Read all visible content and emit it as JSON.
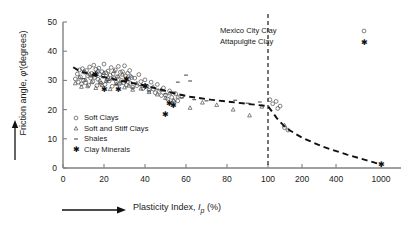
{
  "chart_data": {
    "type": "scatter",
    "title": "",
    "xlabel": "Plasticity Index, Ip (%)",
    "ylabel": "Friction angle, φ'(degrees)",
    "xlabel_parts": {
      "pre": "Plasticity Index, ",
      "sym": "I",
      "sub": "p",
      "post": " (%)"
    },
    "ylabel_parts": {
      "pre": "Friction angle, ",
      "sym": "φ′",
      "post": "(degrees)"
    },
    "x_axis": {
      "type": "linear-then-log",
      "ticks": [
        0,
        20,
        40,
        60,
        80,
        100,
        200,
        400,
        1000
      ],
      "tick_labels": [
        "0",
        "20",
        "40",
        "60",
        "80",
        "100",
        "200",
        "400",
        "1000"
      ],
      "linear_max": 100,
      "log_max": 1000
    },
    "y_axis": {
      "type": "linear",
      "ticks": [
        0,
        10,
        20,
        30,
        40,
        50
      ],
      "tick_labels": [
        "0",
        "10",
        "20",
        "30",
        "40",
        "50"
      ],
      "ylim": [
        0,
        50
      ]
    },
    "grid": false,
    "annotations": [
      {
        "name": "divider",
        "type": "vertical-dashed-line",
        "x": 100
      }
    ],
    "trend_line": {
      "style": "dashed",
      "points": [
        [
          5,
          34.5
        ],
        [
          8,
          33.2
        ],
        [
          12,
          32.4
        ],
        [
          18,
          31.4
        ],
        [
          24,
          30.6
        ],
        [
          30,
          29.6
        ],
        [
          38,
          28.6
        ],
        [
          46,
          27.2
        ],
        [
          54,
          25.6
        ],
        [
          62,
          24.4
        ],
        [
          72,
          23.4
        ],
        [
          82,
          22.6
        ],
        [
          92,
          21.8
        ],
        [
          100,
          21.2
        ],
        [
          120,
          17.0
        ],
        [
          145,
          13.6
        ],
        [
          200,
          10.4
        ],
        [
          300,
          7.4
        ],
        [
          500,
          4.6
        ],
        [
          750,
          2.6
        ],
        [
          1000,
          1.2
        ]
      ]
    },
    "legend_main": {
      "position": "inside-lower-left",
      "entries": [
        {
          "label": "Soft Clays",
          "marker": "open-circle"
        },
        {
          "label": "Soft and Stiff Clays",
          "marker": "triangle"
        },
        {
          "label": "Shales",
          "marker": "dash"
        },
        {
          "label": "Clay Minerals",
          "marker": "asterisk"
        }
      ]
    },
    "legend_right": {
      "position": "top-right",
      "entries": [
        {
          "label": "Mexico City Clay",
          "marker": "open-circle"
        },
        {
          "label": "Attapulgite Clay",
          "marker": "asterisk"
        }
      ]
    },
    "series": [
      {
        "name": "Soft Clays",
        "marker": "open-circle",
        "points": [
          [
            6,
            30.5
          ],
          [
            7,
            32.2
          ],
          [
            7.5,
            29.4
          ],
          [
            8,
            33.6
          ],
          [
            8.5,
            31.2
          ],
          [
            9,
            28.8
          ],
          [
            9.5,
            34.0
          ],
          [
            10,
            30.0
          ],
          [
            10.5,
            32.8
          ],
          [
            11,
            29.2
          ],
          [
            11.5,
            33.4
          ],
          [
            12,
            31.6
          ],
          [
            12.5,
            28.4
          ],
          [
            13,
            34.6
          ],
          [
            13.5,
            30.8
          ],
          [
            14,
            32.4
          ],
          [
            14.5,
            29.6
          ],
          [
            15,
            35.2
          ],
          [
            15.5,
            31.0
          ],
          [
            16,
            33.8
          ],
          [
            16.5,
            28.2
          ],
          [
            17,
            30.4
          ],
          [
            17.5,
            34.2
          ],
          [
            18,
            32.0
          ],
          [
            18.5,
            29.0
          ],
          [
            19,
            33.0
          ],
          [
            19.5,
            31.4
          ],
          [
            20,
            35.6
          ],
          [
            20.5,
            28.6
          ],
          [
            21,
            32.6
          ],
          [
            21.5,
            30.2
          ],
          [
            22,
            33.2
          ],
          [
            22.5,
            29.8
          ],
          [
            23,
            31.8
          ],
          [
            23.5,
            34.4
          ],
          [
            24,
            28.0
          ],
          [
            24.5,
            32.2
          ],
          [
            25,
            30.6
          ],
          [
            25.5,
            33.6
          ],
          [
            26,
            29.4
          ],
          [
            26.5,
            31.2
          ],
          [
            27,
            34.8
          ],
          [
            27.5,
            28.8
          ],
          [
            28,
            32.8
          ],
          [
            28.5,
            30.0
          ],
          [
            29,
            33.0
          ],
          [
            29.5,
            29.2
          ],
          [
            30,
            35.0
          ],
          [
            30.5,
            31.6
          ],
          [
            31,
            28.4
          ],
          [
            31.5,
            32.4
          ],
          [
            32,
            30.4
          ],
          [
            32.5,
            33.4
          ],
          [
            33,
            29.0
          ],
          [
            33.5,
            31.0
          ],
          [
            34,
            27.6
          ],
          [
            35,
            30.8
          ],
          [
            36,
            28.2
          ],
          [
            37,
            32.0
          ],
          [
            38,
            29.6
          ],
          [
            39,
            27.2
          ],
          [
            40,
            30.2
          ],
          [
            41,
            28.0
          ],
          [
            42,
            26.6
          ],
          [
            43,
            29.4
          ],
          [
            44,
            27.0
          ],
          [
            45,
            25.8
          ],
          [
            46,
            28.6
          ],
          [
            47,
            26.2
          ],
          [
            48,
            24.8
          ],
          [
            49,
            27.4
          ],
          [
            50,
            25.0
          ],
          [
            51,
            23.6
          ],
          [
            52,
            26.4
          ],
          [
            53,
            24.2
          ],
          [
            54,
            22.8
          ],
          [
            55,
            25.4
          ],
          [
            56,
            23.0
          ],
          [
            58,
            24.6
          ]
        ]
      },
      {
        "name": "Soft and Stiff Clays",
        "marker": "triangle",
        "points": [
          [
            6,
            29.0
          ],
          [
            8,
            31.0
          ],
          [
            9,
            27.8
          ],
          [
            10,
            33.0
          ],
          [
            11,
            30.2
          ],
          [
            12,
            28.0
          ],
          [
            13,
            32.2
          ],
          [
            14,
            29.4
          ],
          [
            15,
            31.8
          ],
          [
            16,
            27.4
          ],
          [
            17,
            33.4
          ],
          [
            18,
            30.0
          ],
          [
            19,
            28.4
          ],
          [
            20,
            32.6
          ],
          [
            21,
            29.8
          ],
          [
            22,
            31.2
          ],
          [
            23,
            27.0
          ],
          [
            24,
            30.6
          ],
          [
            25,
            33.2
          ],
          [
            26,
            28.8
          ],
          [
            27,
            31.4
          ],
          [
            28,
            29.2
          ],
          [
            29,
            32.0
          ],
          [
            30,
            27.6
          ],
          [
            31,
            30.4
          ],
          [
            32,
            28.2
          ],
          [
            33,
            31.6
          ],
          [
            34,
            26.8
          ],
          [
            36,
            29.0
          ],
          [
            38,
            27.2
          ],
          [
            40,
            28.4
          ],
          [
            42,
            26.0
          ],
          [
            44,
            27.8
          ],
          [
            46,
            25.2
          ],
          [
            48,
            26.8
          ],
          [
            50,
            24.0
          ],
          [
            52,
            25.6
          ],
          [
            54,
            23.2
          ],
          [
            56,
            24.4
          ],
          [
            62,
            20.6
          ],
          [
            68,
            22.4
          ],
          [
            75,
            21.6
          ],
          [
            83,
            20.0
          ],
          [
            91,
            18.0
          ],
          [
            97,
            21.0
          ],
          [
            140,
            14.6
          ]
        ]
      },
      {
        "name": "Shales",
        "marker": "dash",
        "points": [
          [
            10,
            30.6
          ],
          [
            14,
            31.2
          ],
          [
            18,
            29.0
          ],
          [
            22,
            30.0
          ],
          [
            26,
            28.6
          ],
          [
            30,
            29.8
          ],
          [
            34,
            27.4
          ],
          [
            38,
            28.2
          ],
          [
            42,
            26.4
          ],
          [
            46,
            27.0
          ],
          [
            50,
            25.4
          ],
          [
            54,
            26.0
          ],
          [
            56,
            29.4
          ],
          [
            58,
            24.0
          ],
          [
            60,
            31.8
          ],
          [
            62,
            29.8
          ],
          [
            64,
            23.4
          ],
          [
            70,
            23.0
          ],
          [
            78,
            22.8
          ],
          [
            84,
            23.2
          ],
          [
            90,
            22.2
          ],
          [
            96,
            22.6
          ]
        ]
      },
      {
        "name": "Clay Minerals",
        "marker": "asterisk",
        "points": [
          [
            16,
            32.0
          ],
          [
            20,
            27.0
          ],
          [
            27,
            26.8
          ],
          [
            31,
            30.2
          ],
          [
            40,
            28.0
          ],
          [
            50,
            18.4
          ],
          [
            52,
            22.2
          ],
          [
            54,
            21.4
          ]
        ]
      },
      {
        "name": "Mexico City Clay",
        "marker": "open-circle",
        "points": [
          [
            104,
            23.4
          ],
          [
            110,
            22.0
          ],
          [
            118,
            22.8
          ],
          [
            122,
            20.4
          ],
          [
            128,
            21.2
          ],
          [
            140,
            13.8
          ],
          [
            150,
            13.0
          ]
        ]
      },
      {
        "name": "Attapulgite Clay",
        "marker": "asterisk",
        "points": [
          [
            1000,
            1.2
          ]
        ]
      }
    ]
  },
  "colors": {
    "axis": "#808080",
    "text": "#1a1a1a",
    "trend": "#111111",
    "marker": "#4d4d4d"
  }
}
